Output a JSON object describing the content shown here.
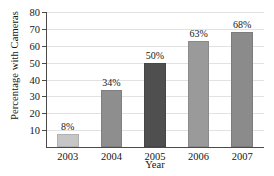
{
  "chart_data": {
    "type": "bar",
    "title": "",
    "xlabel": "Year",
    "ylabel": "Percentage with Cameras",
    "categories": [
      "2003",
      "2004",
      "2005",
      "2006",
      "2007"
    ],
    "values": [
      8,
      34,
      50,
      63,
      68
    ],
    "data_labels": [
      "8%",
      "34%",
      "50%",
      "63%",
      "68%"
    ],
    "bar_colors": [
      "#c6c6c6",
      "#8e8e8e",
      "#4f4f4f",
      "#9a9a9a",
      "#8b8b8b"
    ],
    "ylim": [
      0,
      80
    ],
    "yticks": [
      10,
      20,
      30,
      40,
      50,
      60,
      70,
      80
    ],
    "ytick_labels": [
      "10",
      "20",
      "30",
      "40",
      "50",
      "60",
      "70",
      "80"
    ],
    "grid": true,
    "grid_color": "#e2e2e2",
    "axis_color": "#4a4a4a",
    "legend": "none",
    "background": "#ffffff"
  }
}
